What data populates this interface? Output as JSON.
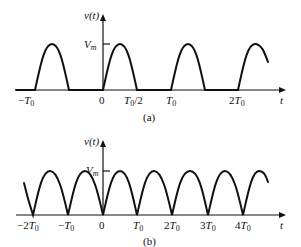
{
  "panels": [
    {
      "id": "a",
      "caption": "(a)",
      "title": "Half-wave rectified sinusoid",
      "y_label": "v(t)",
      "x_label": "t",
      "peak_label": "V_m",
      "ticks": [
        "-T0",
        "0",
        "T0/2",
        "T0",
        "2T0"
      ]
    },
    {
      "id": "b",
      "caption": "(b)",
      "title": "Full-wave rectified sinusoid",
      "y_label": "v(t)",
      "x_label": "t",
      "peak_label": "V_m",
      "ticks": [
        "-2T0",
        "-T0",
        "0",
        "T0",
        "2T0",
        "3T0",
        "4T0"
      ]
    }
  ],
  "text": {
    "a_caption": "(a)",
    "b_caption": "(b)",
    "vt": "v(t)",
    "t": "t",
    "V": "V",
    "m": "m",
    "T": "T",
    "sub0": "0",
    "zero": "0",
    "minus": "−",
    "two": "2",
    "three": "3",
    "four": "4",
    "half": "/2"
  }
}
